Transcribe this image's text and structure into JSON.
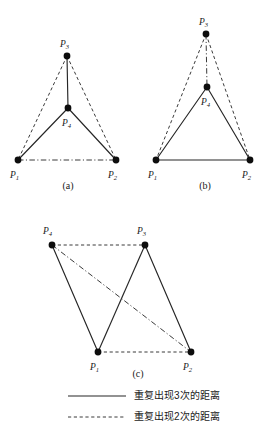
{
  "figure": {
    "title": "",
    "node_radius": 3.4,
    "colors": {
      "solid": "#262626",
      "dashed": "#3a3a3a",
      "dashdot": "#3a3a3a",
      "node": "#0d0d0d",
      "background": "#ffffff"
    },
    "panels": [
      {
        "id": "a",
        "caption": "(a)",
        "nodes": [
          {
            "id": "P1",
            "label": "P",
            "sub": "1",
            "x": 18,
            "y": 160,
            "label_x": 10,
            "label_y": 178
          },
          {
            "id": "P2",
            "label": "P",
            "sub": "2",
            "x": 116,
            "y": 160,
            "label_x": 108,
            "label_y": 178
          },
          {
            "id": "P3",
            "label": "P",
            "sub": "3",
            "x": 67,
            "y": 56,
            "label_x": 60,
            "label_y": 47
          },
          {
            "id": "P4",
            "label": "P",
            "sub": "4",
            "x": 68,
            "y": 108,
            "label_x": 62,
            "label_y": 126
          }
        ],
        "edges": [
          {
            "from": "P3",
            "to": "P4",
            "style": "solid"
          },
          {
            "from": "P4",
            "to": "P1",
            "style": "solid"
          },
          {
            "from": "P4",
            "to": "P2",
            "style": "solid"
          },
          {
            "from": "P3",
            "to": "P1",
            "style": "dashed"
          },
          {
            "from": "P3",
            "to": "P2",
            "style": "dashed"
          },
          {
            "from": "P1",
            "to": "P2",
            "style": "dashdot"
          }
        ]
      },
      {
        "id": "b",
        "caption": "(b)",
        "nodes": [
          {
            "id": "P1",
            "label": "P",
            "sub": "1",
            "x": 20,
            "y": 160,
            "label_x": 12,
            "label_y": 178
          },
          {
            "id": "P2",
            "label": "P",
            "sub": "2",
            "x": 114,
            "y": 160,
            "label_x": 106,
            "label_y": 178
          },
          {
            "id": "P3",
            "label": "P",
            "sub": "3",
            "x": 70,
            "y": 34,
            "label_x": 63,
            "label_y": 25
          },
          {
            "id": "P4",
            "label": "P",
            "sub": "4",
            "x": 71,
            "y": 87,
            "label_x": 65,
            "label_y": 105
          }
        ],
        "edges": [
          {
            "from": "P3",
            "to": "P4",
            "style": "dashdot"
          },
          {
            "from": "P3",
            "to": "P1",
            "style": "dashed"
          },
          {
            "from": "P3",
            "to": "P2",
            "style": "dashed"
          },
          {
            "from": "P4",
            "to": "P1",
            "style": "solid"
          },
          {
            "from": "P4",
            "to": "P2",
            "style": "solid"
          },
          {
            "from": "P1",
            "to": "P2",
            "style": "solid"
          }
        ]
      },
      {
        "id": "c",
        "caption": "(c)",
        "nodes": [
          {
            "id": "P4",
            "label": "P",
            "sub": "4",
            "x": 22,
            "y": 45,
            "label_x": 13,
            "label_y": 34
          },
          {
            "id": "P3",
            "label": "P",
            "sub": "3",
            "x": 115,
            "y": 45,
            "label_x": 107,
            "label_y": 34
          },
          {
            "id": "P1",
            "label": "P",
            "sub": "1",
            "x": 68,
            "y": 152,
            "label_x": 60,
            "label_y": 170
          },
          {
            "id": "P2",
            "label": "P",
            "sub": "2",
            "x": 161,
            "y": 152,
            "label_x": 153,
            "label_y": 170
          }
        ],
        "edges": [
          {
            "from": "P4",
            "to": "P3",
            "style": "dashed"
          },
          {
            "from": "P4",
            "to": "P1",
            "style": "solid"
          },
          {
            "from": "P3",
            "to": "P1",
            "style": "solid"
          },
          {
            "from": "P3",
            "to": "P2",
            "style": "solid"
          },
          {
            "from": "P1",
            "to": "P2",
            "style": "dashed"
          },
          {
            "from": "P4",
            "to": "P2",
            "style": "dashdot"
          }
        ]
      }
    ],
    "legend": [
      {
        "style": "solid",
        "label": "重复出现3次的距离"
      },
      {
        "style": "dashed",
        "label": "重复出现2次的距离"
      }
    ]
  }
}
